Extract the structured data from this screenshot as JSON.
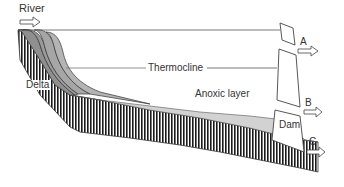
{
  "diagram": {
    "labels": {
      "river": "River",
      "delta": "Delta",
      "thermocline": "Thermocline",
      "anoxic": "Anoxic layer",
      "dam": "Dam",
      "outlet_a": "A",
      "outlet_b": "B",
      "outlet_c": "C"
    },
    "colors": {
      "sediment_dark": "#8a8a8a",
      "sediment_light": "#cfcfcf",
      "line": "#444444",
      "hatch": "#1a1a1a"
    }
  }
}
